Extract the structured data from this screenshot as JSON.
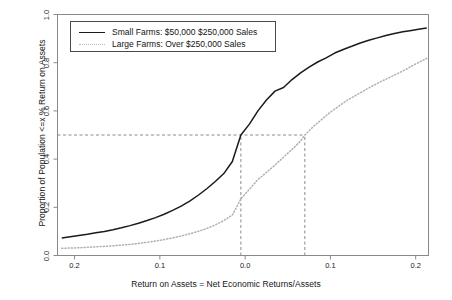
{
  "chart_data": {
    "type": "line",
    "title": "",
    "subtitle": "",
    "xlabel": "Return on Assets = Net Economic Returns/Assets",
    "ylabel": "Proportion of Population <=x % Return on Assets",
    "xlim": [
      -0.22,
      0.215
    ],
    "ylim": [
      0.0,
      1.0
    ],
    "grid": false,
    "legend_position": "top-left",
    "xticks": [
      {
        "value": -0.2,
        "label": "0.2"
      },
      {
        "value": -0.1,
        "label": "0.1"
      },
      {
        "value": 0.0,
        "label": "0.0"
      },
      {
        "value": 0.1,
        "label": "0.1"
      },
      {
        "value": 0.2,
        "label": "0.2"
      }
    ],
    "yticks": [
      {
        "value": 0.0,
        "label": "0.0"
      },
      {
        "value": 0.2,
        "label": "0.2"
      },
      {
        "value": 0.4,
        "label": "0.4"
      },
      {
        "value": 0.6,
        "label": "0.6"
      },
      {
        "value": 0.8,
        "label": "0.8"
      },
      {
        "value": 1.0,
        "label": "1.0"
      }
    ],
    "series": [
      {
        "name": "Small Farms: $50,000  $250,000 Sales",
        "style": "solid",
        "color": "#1a1a1a",
        "x": [
          -0.215,
          -0.205,
          -0.195,
          -0.185,
          -0.175,
          -0.165,
          -0.155,
          -0.145,
          -0.135,
          -0.125,
          -0.115,
          -0.105,
          -0.095,
          -0.085,
          -0.075,
          -0.065,
          -0.055,
          -0.045,
          -0.035,
          -0.025,
          -0.015,
          -0.005,
          0.005,
          0.015,
          0.025,
          0.035,
          0.045,
          0.055,
          0.065,
          0.075,
          0.085,
          0.095,
          0.105,
          0.115,
          0.125,
          0.135,
          0.145,
          0.155,
          0.165,
          0.175,
          0.185,
          0.195,
          0.205,
          0.213
        ],
        "y": [
          0.073,
          0.078,
          0.083,
          0.088,
          0.094,
          0.1,
          0.107,
          0.115,
          0.124,
          0.134,
          0.145,
          0.157,
          0.171,
          0.187,
          0.205,
          0.226,
          0.25,
          0.277,
          0.307,
          0.34,
          0.39,
          0.5,
          0.545,
          0.6,
          0.645,
          0.682,
          0.697,
          0.73,
          0.758,
          0.782,
          0.803,
          0.82,
          0.84,
          0.855,
          0.868,
          0.882,
          0.893,
          0.903,
          0.913,
          0.921,
          0.928,
          0.934,
          0.94,
          0.944
        ]
      },
      {
        "name": "Large Farms: Over $250,000 Sales",
        "style": "dotted",
        "color": "#b0b0b0",
        "x": [
          -0.215,
          -0.205,
          -0.195,
          -0.185,
          -0.175,
          -0.165,
          -0.155,
          -0.145,
          -0.135,
          -0.125,
          -0.115,
          -0.105,
          -0.095,
          -0.085,
          -0.075,
          -0.065,
          -0.055,
          -0.045,
          -0.035,
          -0.025,
          -0.015,
          -0.005,
          0.005,
          0.015,
          0.025,
          0.035,
          0.045,
          0.055,
          0.065,
          0.07,
          0.08,
          0.09,
          0.1,
          0.11,
          0.12,
          0.13,
          0.14,
          0.15,
          0.16,
          0.17,
          0.18,
          0.19,
          0.2,
          0.213
        ],
        "y": [
          0.03,
          0.031,
          0.032,
          0.034,
          0.036,
          0.038,
          0.04,
          0.043,
          0.046,
          0.05,
          0.055,
          0.06,
          0.066,
          0.073,
          0.081,
          0.09,
          0.1,
          0.112,
          0.127,
          0.145,
          0.168,
          0.235,
          0.275,
          0.315,
          0.345,
          0.375,
          0.408,
          0.44,
          0.475,
          0.5,
          0.535,
          0.565,
          0.595,
          0.62,
          0.645,
          0.665,
          0.685,
          0.705,
          0.723,
          0.74,
          0.757,
          0.775,
          0.795,
          0.818
        ]
      }
    ],
    "annotations": [
      {
        "type": "hline",
        "y": 0.5,
        "x_from": -0.22,
        "x_to": 0.07,
        "style": "dashed"
      },
      {
        "type": "vline",
        "x": -0.005,
        "y_from": 0.0,
        "y_to": 0.5,
        "style": "dashed"
      },
      {
        "type": "vline",
        "x": 0.07,
        "y_from": 0.0,
        "y_to": 0.5,
        "style": "dashed"
      }
    ]
  },
  "legend": {
    "entries": [
      {
        "label": "Small Farms: $50,000  $250,000 Sales"
      },
      {
        "label": "Large Farms: Over $250,000 Sales"
      }
    ]
  },
  "colors": {
    "solid_series": "#1a1a1a",
    "dotted_series": "#b0b0b0",
    "axis": "#7a7a7a",
    "annotation": "#8a8a8a",
    "background": "#ffffff"
  }
}
